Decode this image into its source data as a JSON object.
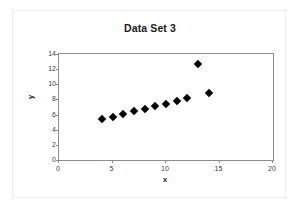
{
  "chart_data": {
    "type": "scatter",
    "title": "Data Set 3",
    "xlabel": "x",
    "ylabel": "y",
    "xlim": [
      0,
      20
    ],
    "ylim": [
      0,
      14
    ],
    "xticks": [
      0,
      5,
      10,
      15,
      20
    ],
    "yticks": [
      0,
      2,
      4,
      6,
      8,
      10,
      12,
      14
    ],
    "grid": false,
    "legend": null,
    "marker": "diamond",
    "marker_color": "#000000",
    "series": [
      {
        "name": "Data Set 3",
        "x": [
          4,
          5,
          6,
          7,
          8,
          9,
          10,
          11,
          12,
          13,
          14
        ],
        "y": [
          5.39,
          5.73,
          6.08,
          6.42,
          6.77,
          7.11,
          7.46,
          7.81,
          8.15,
          12.74,
          8.84
        ],
        "points": [
          {
            "x": 4,
            "y": 5.39
          },
          {
            "x": 5,
            "y": 5.73
          },
          {
            "x": 6,
            "y": 6.08
          },
          {
            "x": 7,
            "y": 6.42
          },
          {
            "x": 8,
            "y": 6.77
          },
          {
            "x": 9,
            "y": 7.11
          },
          {
            "x": 10,
            "y": 7.46
          },
          {
            "x": 11,
            "y": 7.81
          },
          {
            "x": 12,
            "y": 8.15
          },
          {
            "x": 13,
            "y": 12.74
          },
          {
            "x": 14,
            "y": 8.84
          }
        ]
      }
    ]
  },
  "colors": {
    "plot_border": "#8c8c8c",
    "frame_border": "#ececed",
    "marker": "#000000",
    "tick_text": "#3c3c3c",
    "title_text": "#1a1a1a",
    "background": "#ffffff"
  }
}
